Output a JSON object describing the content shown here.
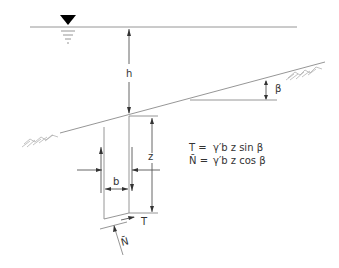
{
  "diagram": {
    "type": "infinite-slope-slice",
    "labels": {
      "water_depth": "h",
      "slope_angle": "β",
      "slice_width": "b",
      "slice_depth": "z",
      "shear_force": "T",
      "normal_force": "N̄"
    },
    "equations": [
      {
        "lhs": "T =",
        "rhs": "γ′b z sin β"
      },
      {
        "lhs": "N̄ =",
        "rhs": "γ′b z cos β"
      }
    ],
    "colors": {
      "line": "#8a8a8a",
      "text": "#333333",
      "water_marker": "#000000"
    }
  }
}
